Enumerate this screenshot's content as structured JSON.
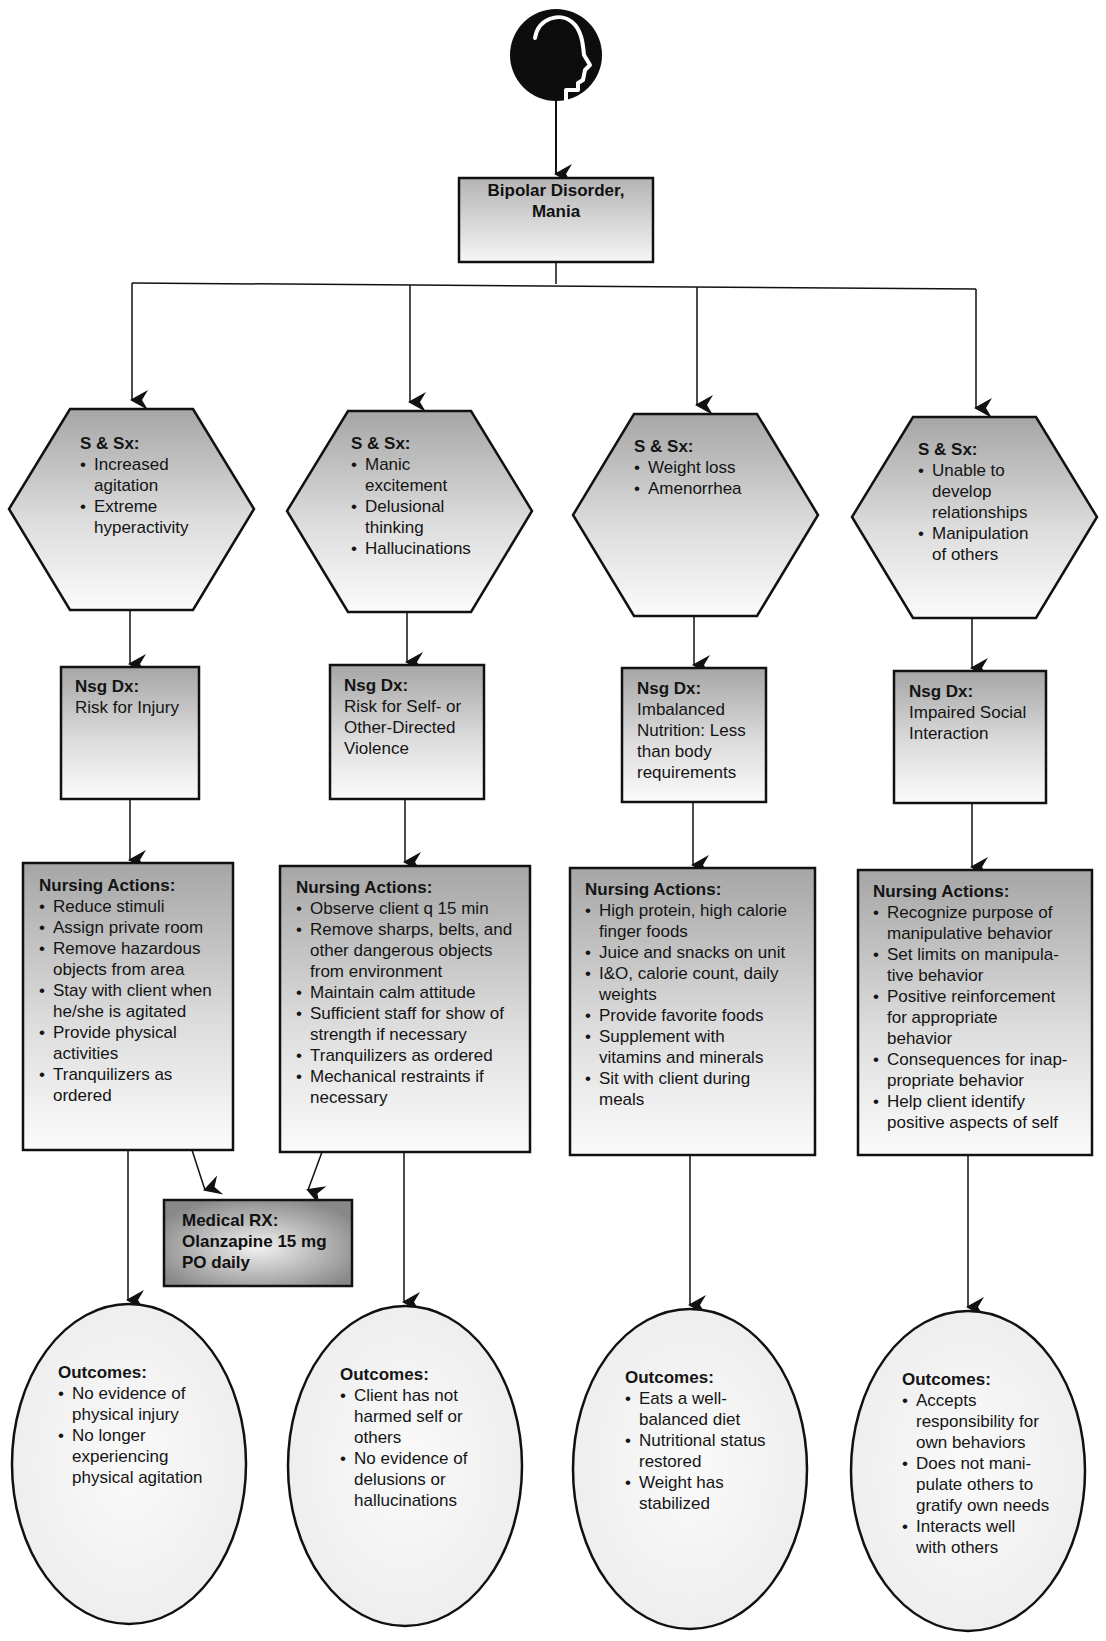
{
  "diagram": {
    "type": "nursing-concept-map",
    "root": {
      "icon": "head-profile-icon",
      "title_line1": "Bipolar Disorder,",
      "title_line2": "Mania"
    },
    "colors": {
      "line": "#111111",
      "shape_top": "#a8a8a8",
      "shape_bottom": "#fafafa",
      "ellipse_fill": "#f4f4f4",
      "rx_dark": "#8a8a8a"
    },
    "branches": [
      {
        "sx": {
          "title": "S & Sx:",
          "items": [
            "Increased agitation",
            "Extreme hyperactivity"
          ]
        },
        "dx": {
          "title": "Nsg Dx:",
          "lines": [
            "Risk for Injury"
          ]
        },
        "actions": {
          "title": "Nursing Actions:",
          "items": [
            "Reduce stimuli",
            "Assign private room",
            "Remove hazardous objects from area",
            "Stay with client when he/she is agitated",
            "Provide physical activities",
            "Tranquilizers as ordered"
          ]
        },
        "outcomes": {
          "title": "Outcomes:",
          "items": [
            "No evidence of physical injury",
            "No longer experiencing physical agitation"
          ]
        }
      },
      {
        "sx": {
          "title": "S & Sx:",
          "items": [
            "Manic excitement",
            "Delusional thinking",
            "Hallucinations"
          ]
        },
        "dx": {
          "title": "Nsg Dx:",
          "lines": [
            "Risk for Self- or",
            "Other-Directed",
            "Violence"
          ]
        },
        "actions": {
          "title": "Nursing Actions:",
          "items": [
            "Observe client q 15 min",
            "Remove sharps, belts, and other dangerous objects from environment",
            "Maintain calm attitude",
            "Sufficient staff for show of strength if necessary",
            "Tranquilizers as ordered",
            "Mechanical restraints if necessary"
          ]
        },
        "outcomes": {
          "title": "Outcomes:",
          "items": [
            "Client has not harmed self or others",
            "No evidence of delusions or hallucinations"
          ]
        }
      },
      {
        "sx": {
          "title": "S & Sx:",
          "items": [
            "Weight loss",
            "Amenorrhea"
          ]
        },
        "dx": {
          "title": "Nsg Dx:",
          "lines": [
            "Imbalanced",
            "Nutrition: Less",
            "than body",
            "requirements"
          ]
        },
        "actions": {
          "title": "Nursing Actions:",
          "items": [
            "High protein, high calorie finger foods",
            "Juice and snacks on unit",
            "I&O, calorie count, daily weights",
            "Provide favorite foods",
            "Supplement with vitamins and minerals",
            "Sit with client during meals"
          ]
        },
        "outcomes": {
          "title": "Outcomes:",
          "items": [
            "Eats a well-balanced diet",
            "Nutritional status restored",
            "Weight has stabilized"
          ]
        }
      },
      {
        "sx": {
          "title": "S & Sx:",
          "items": [
            "Unable to develop relationships",
            "Manipulation of others"
          ]
        },
        "dx": {
          "title": "Nsg Dx:",
          "lines": [
            "Impaired Social",
            "Interaction"
          ]
        },
        "actions": {
          "title": "Nursing Actions:",
          "items": [
            "Recognize purpose of manipulative behavior",
            "Set limits on manipula-tive behavior",
            "Positive reinforcement for appropriate behavior",
            "Consequences for inap-propriate behavior",
            "Help client identify positive aspects of self"
          ]
        },
        "outcomes": {
          "title": "Outcomes:",
          "items": [
            "Accepts responsibility for own behaviors",
            "Does not mani-pulate others to gratify own needs",
            "Interacts well with others"
          ]
        }
      }
    ],
    "medical_rx": {
      "title": "Medical RX:",
      "line1": "Olanzapine 15 mg",
      "line2": "PO daily"
    }
  }
}
